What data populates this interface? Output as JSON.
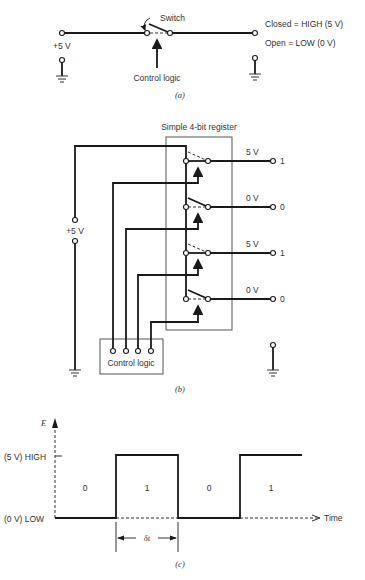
{
  "panel_a": {
    "supply_label": "+5 V",
    "switch_label": "Switch",
    "control_label": "Control logic",
    "closed_label": "Closed = HIGH (5 V)",
    "open_label": "Open = LOW (0 V)",
    "caption": "(a)"
  },
  "panel_b": {
    "title": "Simple 4-bit register",
    "supply_label": "+5 V",
    "control_label": "Control logic",
    "caption": "(b)",
    "bits": [
      {
        "voltage": "5 V",
        "value": "1",
        "state": "closed"
      },
      {
        "voltage": "0 V",
        "value": "0",
        "state": "open"
      },
      {
        "voltage": "5 V",
        "value": "1",
        "state": "closed"
      },
      {
        "voltage": "0 V",
        "value": "0",
        "state": "open"
      }
    ]
  },
  "panel_c": {
    "y_axis_label": "E",
    "high_label": "(5 V) HIGH",
    "low_label": "(0 V) LOW",
    "x_axis_label": "Time",
    "interval_label": "δt",
    "caption": "(c)",
    "bit_labels": [
      "0",
      "1",
      "0",
      "1"
    ]
  }
}
